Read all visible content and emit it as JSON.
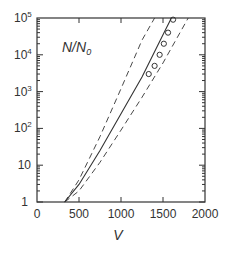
{
  "chart_data": {
    "type": "line",
    "title": "",
    "annotation": "N/N0",
    "xlabel": "V",
    "ylabel": "",
    "xlim": [
      0,
      2000
    ],
    "ylim": [
      1,
      100000
    ],
    "yscale": "log",
    "x_ticks": [
      "0",
      "500",
      "1000",
      "1500",
      "2000"
    ],
    "y_ticks": [
      "1",
      "10",
      "10^2",
      "10^3",
      "10^4",
      "10^5"
    ],
    "grid": false,
    "series": [
      {
        "name": "theory",
        "style": "solid",
        "x": [
          330,
          500,
          750,
          1000,
          1250,
          1500,
          1600
        ],
        "y": [
          1,
          3,
          25,
          250,
          2500,
          35000,
          100000
        ]
      },
      {
        "name": "upper-bound",
        "style": "dashed",
        "x": [
          330,
          500,
          750,
          1000,
          1250,
          1400
        ],
        "y": [
          1,
          4,
          60,
          1200,
          25000,
          100000
        ]
      },
      {
        "name": "lower-bound",
        "style": "dashed",
        "x": [
          330,
          500,
          750,
          1000,
          1250,
          1500,
          1800
        ],
        "y": [
          1,
          2,
          12,
          90,
          700,
          6000,
          100000
        ]
      },
      {
        "name": "measured",
        "style": "markers",
        "marker": "circle",
        "x": [
          1330,
          1400,
          1460,
          1510,
          1560,
          1620
        ],
        "y": [
          3000,
          5000,
          10000,
          20000,
          40000,
          90000
        ]
      }
    ]
  },
  "labels": {
    "annotation_main": "N/N",
    "annotation_sub": "0",
    "xlabel": "V",
    "xticks": [
      "0",
      "500",
      "1000",
      "1500",
      "2000"
    ],
    "y1": "1",
    "y10": "10",
    "ybase": "10",
    "yexp": [
      "2",
      "3",
      "4",
      "5"
    ]
  }
}
